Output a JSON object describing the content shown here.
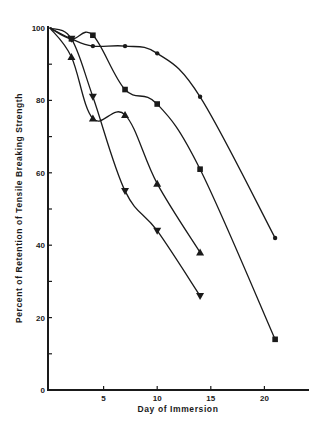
{
  "chart_data": {
    "type": "line",
    "title": "",
    "xlabel": "Day of Immersion",
    "ylabel": "Percent of Retention of Tensile Breaking Strength",
    "xlim": [
      0,
      24
    ],
    "ylim": [
      0,
      100
    ],
    "x_ticks": [
      5,
      10,
      15,
      20
    ],
    "y_ticks": [
      0,
      20,
      40,
      60,
      80,
      100
    ],
    "y_minor_ticks": [
      10,
      30,
      50,
      70,
      90
    ],
    "grid": false,
    "legend": null,
    "series": [
      {
        "name": "circle",
        "marker": "circle",
        "points": [
          [
            0,
            100
          ],
          [
            2,
            97
          ],
          [
            4,
            95
          ],
          [
            7,
            95
          ],
          [
            10,
            93
          ],
          [
            14,
            81
          ],
          [
            21,
            42
          ]
        ]
      },
      {
        "name": "square",
        "marker": "square",
        "points": [
          [
            0,
            100
          ],
          [
            2,
            97
          ],
          [
            4,
            98
          ],
          [
            7,
            83
          ],
          [
            10,
            79
          ],
          [
            14,
            61
          ],
          [
            21,
            14
          ]
        ]
      },
      {
        "name": "triangle-up",
        "marker": "triangle-up",
        "points": [
          [
            0,
            100
          ],
          [
            2,
            92
          ],
          [
            4,
            75
          ],
          [
            7,
            76
          ],
          [
            10,
            57
          ],
          [
            14,
            38
          ]
        ]
      },
      {
        "name": "triangle-down",
        "marker": "triangle-down",
        "points": [
          [
            0,
            100
          ],
          [
            2,
            97
          ],
          [
            4,
            81
          ],
          [
            7,
            55
          ],
          [
            10,
            44
          ],
          [
            14,
            26
          ]
        ]
      }
    ]
  },
  "colors": {
    "ink": "#1a1a1a",
    "background": "#ffffff"
  }
}
